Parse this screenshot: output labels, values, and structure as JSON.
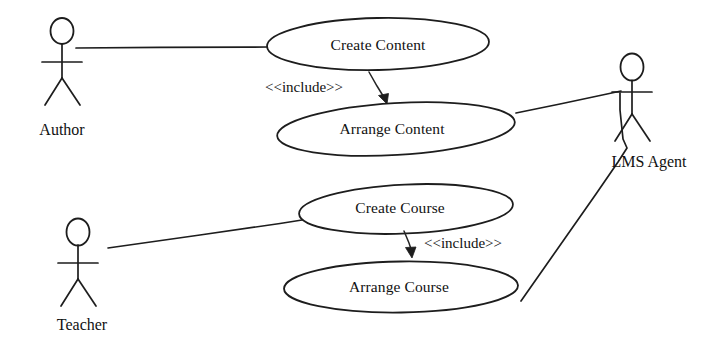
{
  "diagram": {
    "kind": "uml-use-case-diagram",
    "background_color": "#ffffff",
    "line_color": "#1d1d1d",
    "text_color": "#111111",
    "width": 722,
    "height": 349
  },
  "actors": {
    "author": {
      "label": "Author"
    },
    "teacher": {
      "label": "Teacher"
    },
    "lms_agent": {
      "label": "LMS Agent"
    }
  },
  "use_cases": {
    "create_content": {
      "label": "Create Content"
    },
    "arrange_content": {
      "label": "Arrange Content"
    },
    "create_course": {
      "label": "Create Course"
    },
    "arrange_course": {
      "label": "Arrange Course"
    }
  },
  "relationships": {
    "include_content": {
      "label": "<<include>>"
    },
    "include_course": {
      "label": "<<include>>"
    }
  }
}
